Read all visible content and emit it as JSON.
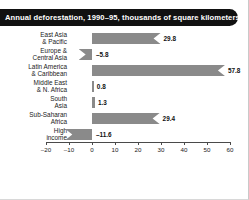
{
  "title": "Annual deforestation, 1990–95, thousands of square kilometers",
  "colors": {
    "bar_fill": "#8a8a8a",
    "title_banner": "#111111",
    "title_text": "#ffffff",
    "axis": "#4a4a4a",
    "background": "#ffffff"
  },
  "axis": {
    "ticks": [
      {
        "label": "–20",
        "value": -20
      },
      {
        "label": "–10",
        "value": -10
      },
      {
        "label": "0",
        "value": 0
      },
      {
        "label": "10",
        "value": 10
      },
      {
        "label": "20",
        "value": 20
      },
      {
        "label": "30",
        "value": 30
      },
      {
        "label": "40",
        "value": 40
      },
      {
        "label": "50",
        "value": 50
      },
      {
        "label": "60",
        "value": 60
      }
    ]
  },
  "rows": [
    {
      "label": "East Asia\n& Pacific",
      "value": 29.8,
      "value_label": "29.8"
    },
    {
      "label": "Europe &\nCentral Asia",
      "value": -5.8,
      "value_label": "–5.8"
    },
    {
      "label": "Latin America\n& Caribbean",
      "value": 57.8,
      "value_label": "57.8"
    },
    {
      "label": "Middle East\n& N. Africa",
      "value": 0.8,
      "value_label": "0.8"
    },
    {
      "label": "South\nAsia",
      "value": 1.3,
      "value_label": "1.3"
    },
    {
      "label": "Sub-Saharan\nAfrica",
      "value": 29.4,
      "value_label": "29.4"
    },
    {
      "label": "High\nincome",
      "value": -11.6,
      "value_label": "–11.6"
    }
  ],
  "chart_data": {
    "type": "bar",
    "orientation": "horizontal",
    "title": "Annual deforestation, 1990–95, thousands of square kilometers",
    "xlabel": "",
    "ylabel": "",
    "categories": [
      "East Asia & Pacific",
      "Europe & Central Asia",
      "Latin America & Caribbean",
      "Middle East & N. Africa",
      "South Asia",
      "Sub-Saharan Africa",
      "High income"
    ],
    "values": [
      29.8,
      -5.8,
      57.8,
      0.8,
      1.3,
      29.4,
      -11.6
    ],
    "data_labels": [
      "29.8",
      "–5.8",
      "57.8",
      "0.8",
      "1.3",
      "29.4",
      "–11.6"
    ],
    "xlim": [
      -20,
      60
    ],
    "xticks": [
      -20,
      -10,
      0,
      10,
      20,
      30,
      40,
      50,
      60
    ],
    "grid": false,
    "legend": null,
    "units": "thousands of square kilometers",
    "period": "1990–95"
  }
}
